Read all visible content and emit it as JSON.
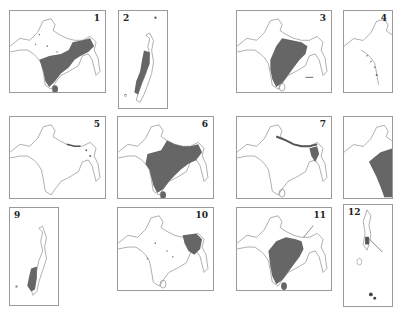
{
  "figure": {
    "fill_color": "#666666",
    "outline_color": "#8a8a8a",
    "frame_color": "#9a9a9a",
    "panels": [
      {
        "label": "1",
        "type": "india",
        "shade": "east-south",
        "x": 9,
        "y": 10,
        "w": 97,
        "h": 83
      },
      {
        "label": "2",
        "type": "islands",
        "shade": "middle",
        "x": 118,
        "y": 10,
        "w": 50,
        "h": 99
      },
      {
        "label": "3",
        "type": "india",
        "shade": "central",
        "x": 236,
        "y": 10,
        "w": 96,
        "h": 83
      },
      {
        "label": "4",
        "type": "india",
        "shade": "west-coast",
        "x": 343,
        "y": 10,
        "w": 50,
        "h": 83
      },
      {
        "label": "5",
        "type": "india",
        "shade": "northeast-dots",
        "x": 9,
        "y": 116,
        "w": 97,
        "h": 83
      },
      {
        "label": "6",
        "type": "india",
        "shade": "most",
        "x": 117,
        "y": 116,
        "w": 97,
        "h": 83
      },
      {
        "label": "7",
        "type": "india",
        "shade": "himalaya-northeast",
        "x": 236,
        "y": 116,
        "w": 96,
        "h": 83
      },
      {
        "label": "8",
        "type": "india",
        "shade": "east",
        "x": 343,
        "y": 116,
        "w": 50,
        "h": 83
      },
      {
        "label": "9",
        "type": "islands",
        "shade": "south",
        "x": 9,
        "y": 207,
        "w": 50,
        "h": 99
      },
      {
        "label": "10",
        "type": "india",
        "shade": "northeast",
        "x": 117,
        "y": 207,
        "w": 97,
        "h": 84
      },
      {
        "label": "11",
        "type": "india",
        "shade": "peninsula",
        "x": 236,
        "y": 207,
        "w": 96,
        "h": 84
      },
      {
        "label": "12",
        "type": "islands",
        "shade": "arrow",
        "x": 343,
        "y": 204,
        "w": 50,
        "h": 103
      }
    ]
  }
}
